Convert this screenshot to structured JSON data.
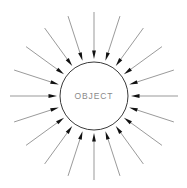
{
  "diagram": {
    "title": "OBJECT",
    "object_label": "OBJECT",
    "label_color": "#8a8a8a",
    "line_color": "#6e6e6e",
    "arrowhead_color": "#111111",
    "circle_stroke": "#3a3a3a",
    "circle_fill": "#ffffff",
    "background": "#ffffff",
    "arrow_count": 20,
    "arrow_direction": "inward",
    "canvas": {
      "width": 187,
      "height": 188
    }
  },
  "chart_data": {
    "type": "scatter",
    "title": "OBJECT",
    "xlabel": "",
    "ylabel": "",
    "center": {
      "x": 94,
      "y": 96
    },
    "circle_radius": 34,
    "arrow_tail_radius": 84,
    "arrow_head_radius": 37,
    "arrow_angles_deg": [
      0,
      18,
      36,
      54,
      72,
      90,
      108,
      126,
      144,
      162,
      180,
      198,
      216,
      234,
      252,
      270,
      288,
      306,
      324,
      342
    ],
    "series": [
      {
        "name": "inward-arrows",
        "values": [
          1,
          1,
          1,
          1,
          1,
          1,
          1,
          1,
          1,
          1,
          1,
          1,
          1,
          1,
          1,
          1,
          1,
          1,
          1,
          1
        ]
      }
    ],
    "legend": [],
    "grid": false
  }
}
